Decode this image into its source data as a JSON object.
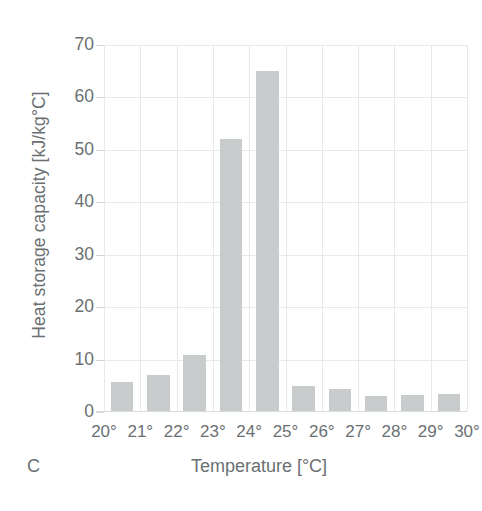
{
  "panel": {
    "label": "C"
  },
  "axes": {
    "y_title": "Heat storage capacity [kJ/kg°C]",
    "x_title": "Temperature [°C]",
    "y_ticks": [
      "0",
      "10",
      "20",
      "30",
      "40",
      "50",
      "60",
      "70"
    ],
    "x_ticks": [
      "20°",
      "21°",
      "22°",
      "23°",
      "24°",
      "25°",
      "26°",
      "27°",
      "28°",
      "29°",
      "30°"
    ]
  },
  "style": {
    "bar_color": "#c9cccd",
    "grid_color": "#e6eaec",
    "text_color": "#6b7072",
    "background": "#ffffff"
  },
  "chart_data": {
    "type": "bar",
    "title": "",
    "subtitle": "",
    "panel_letter": "C",
    "xlabel": "Temperature [°C]",
    "ylabel": "Heat storage capacity [kJ/kg°C]",
    "categories": [
      "20°",
      "21°",
      "22°",
      "23°",
      "24°",
      "25°",
      "26°",
      "27°",
      "28°",
      "29°"
    ],
    "values": [
      5.8,
      7.1,
      10.8,
      52.0,
      65.0,
      4.9,
      4.4,
      3.1,
      3.3,
      3.5
    ],
    "x_tick_labels": [
      "20°",
      "21°",
      "22°",
      "23°",
      "24°",
      "25°",
      "26°",
      "27°",
      "28°",
      "29°",
      "30°"
    ],
    "y_tick_values": [
      0,
      10,
      20,
      30,
      40,
      50,
      60,
      70
    ],
    "ylim": [
      0,
      70
    ],
    "xlim": [
      20,
      30
    ],
    "grid": "both",
    "legend": "none",
    "bar_color": "#c9cccd",
    "annotations": []
  }
}
